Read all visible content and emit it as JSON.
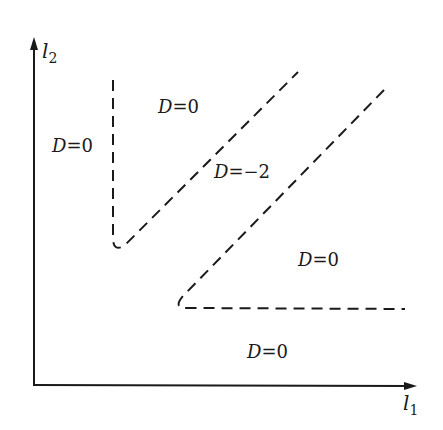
{
  "axes": {
    "x_label": "l",
    "x_sub": "1",
    "y_label": "l",
    "y_sub": "2"
  },
  "regions": [
    {
      "id": "left",
      "var": "D",
      "eq": "=0",
      "x": 52,
      "y": 152
    },
    {
      "id": "upper",
      "var": "D",
      "eq": "=0",
      "x": 158,
      "y": 113
    },
    {
      "id": "middle",
      "var": "D",
      "eq": "=−2",
      "x": 214,
      "y": 178
    },
    {
      "id": "right",
      "var": "D",
      "eq": "=0",
      "x": 298,
      "y": 266
    },
    {
      "id": "bottom",
      "var": "D",
      "eq": "=0",
      "x": 247,
      "y": 358
    }
  ],
  "boundaries": [
    {
      "name": "boundary-upper",
      "style": "dashed"
    },
    {
      "name": "boundary-lower",
      "style": "dashed"
    }
  ],
  "colors": {
    "ink": "#1a1a1a",
    "background": "#ffffff"
  }
}
